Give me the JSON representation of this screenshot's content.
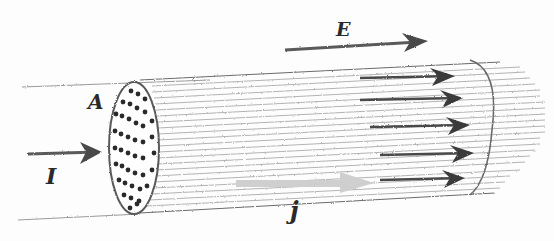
{
  "diagram": {
    "labels": {
      "area": "A",
      "current": "I",
      "electric_field": "E",
      "current_density": "j"
    },
    "colors": {
      "pencil_dark": "#3a3a3a",
      "pencil_light": "#8a8a8a",
      "current_density_arrow": "#cfcfcf",
      "background": "#fdfdfd"
    },
    "field_arrows_inside": 5,
    "charge_dots_on_cross_section": 45
  }
}
